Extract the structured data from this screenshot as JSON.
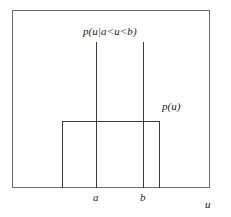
{
  "figure": {
    "colors": {
      "frame": "#6b6b6b",
      "curve": "#3a3a3a",
      "text": "#1a1a1a",
      "background": "#ffffff"
    }
  },
  "labels": {
    "conditional_density": "p(u|a<u<b)",
    "marginal_density": "p(u)",
    "tick_a": "a",
    "tick_b": "b",
    "axis_u": "u"
  },
  "chart_data": {
    "type": "line",
    "title": "",
    "xlabel": "u",
    "ylabel": "",
    "grid": false,
    "legend_position": "inline-annotations",
    "xlim": [
      0,
      1
    ],
    "ylim": [
      0,
      1
    ],
    "annotations": [
      {
        "text": "p(u|a<u<b)",
        "x": 0.55,
        "y": 0.91,
        "describes": "conditional-density"
      },
      {
        "text": "p(u)",
        "x": 0.76,
        "y": 0.49,
        "describes": "marginal-density"
      },
      {
        "text": "a",
        "x": 0.42,
        "y": 0.0,
        "describes": "lower-bound-tick"
      },
      {
        "text": "b",
        "x": 0.66,
        "y": 0.0,
        "describes": "upper-bound-tick"
      },
      {
        "text": "u",
        "x": 0.98,
        "y": -0.06,
        "describes": "axis-label"
      }
    ],
    "series": [
      {
        "name": "p(u)",
        "type": "step",
        "description": "Uniform marginal density: a low, wide rectangle spanning the full support of u",
        "x": [
          0.25,
          0.25,
          0.75,
          0.75
        ],
        "y": [
          0.0,
          0.376,
          0.376,
          0.0
        ]
      },
      {
        "name": "p(u|a<u<b)",
        "type": "step",
        "description": "Conditional density given a<u<b: a tall, narrow rectangle supported on [a,b] with larger height so the area remains one",
        "x": [
          0.425,
          0.425,
          0.665,
          0.665
        ],
        "y": [
          0.0,
          0.82,
          0.82,
          0.0
        ]
      }
    ],
    "markers": {
      "a": 0.425,
      "b": 0.665
    }
  }
}
